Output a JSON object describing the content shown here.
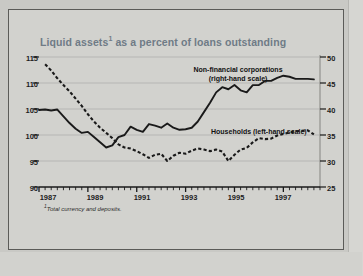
{
  "figure": {
    "background_color": "#d2d2ce",
    "frame_color": "#5b5b58",
    "title_color": "#6f7b86",
    "ink_color": "#1a1a1a"
  },
  "chart_data": {
    "type": "line",
    "title_text_main": "Liquid assets",
    "title_footnote_marker": "1",
    "title_text_rest": " as a percent of loans outstanding",
    "xlabel": "",
    "ylabel": "",
    "grid": true,
    "legend_position": "inline-annotations",
    "footnote": "Total currency and deposits.",
    "footnote_marker": "1",
    "x_axis": {
      "tick_labels": [
        "1987",
        "1989",
        "1991",
        "1993",
        "1995",
        "1997"
      ],
      "tick_values": [
        1987,
        1989,
        1991,
        1993,
        1995,
        1997
      ],
      "minor_tick_interval_years": 0.25,
      "range": [
        1987.0,
        1998.5
      ]
    },
    "y_axis_left": {
      "name": "left-hand scale",
      "tick_labels": [
        "115",
        "110",
        "105",
        "100",
        "95",
        "90"
      ],
      "tick_values": [
        115,
        110,
        105,
        100,
        95,
        90
      ],
      "ylim": [
        90,
        115
      ]
    },
    "y_axis_right": {
      "name": "right-hand scale",
      "tick_labels": [
        "50",
        "45",
        "40",
        "35",
        "30",
        "25"
      ],
      "tick_values": [
        50,
        45,
        40,
        35,
        30,
        25
      ],
      "ylim": [
        25,
        50
      ]
    },
    "series": [
      {
        "name": "Households (left-hand scale)",
        "label_text": "Households (left-hand scale)",
        "axis": "left",
        "style": "dashed",
        "color": "#1a1a1a",
        "x": [
          1987.25,
          1987.5,
          1987.75,
          1988.0,
          1988.25,
          1988.5,
          1988.75,
          1989.0,
          1989.25,
          1989.5,
          1989.75,
          1990.0,
          1990.25,
          1990.5,
          1990.75,
          1991.0,
          1991.25,
          1991.5,
          1991.75,
          1992.0,
          1992.25,
          1992.5,
          1992.75,
          1993.0,
          1993.25,
          1993.5,
          1993.75,
          1994.0,
          1994.25,
          1994.5,
          1994.75,
          1995.0,
          1995.25,
          1995.5,
          1995.75,
          1996.0,
          1996.25,
          1996.5,
          1996.75,
          1997.0,
          1997.25,
          1997.5,
          1997.75,
          1998.0,
          1998.25
        ],
        "values": [
          113.6,
          112.4,
          110.9,
          109.6,
          108.4,
          107.0,
          105.6,
          104.0,
          102.6,
          101.4,
          100.4,
          99.4,
          98.2,
          97.6,
          97.4,
          96.9,
          96.3,
          95.6,
          96.2,
          96.4,
          95.0,
          96.0,
          96.6,
          96.4,
          97.0,
          97.4,
          97.2,
          96.9,
          97.2,
          96.8,
          95.0,
          96.2,
          97.2,
          97.5,
          98.6,
          99.4,
          99.2,
          99.3,
          99.9,
          100.2,
          100.5,
          100.7,
          100.8,
          100.9,
          100.1
        ]
      },
      {
        "name": "Non-financial corporations (right-hand scale)",
        "label_line1": "Non-financial corporations",
        "label_line2": "(right-hand scale)",
        "axis": "right",
        "style": "solid",
        "color": "#1a1a1a",
        "x": [
          1987.0,
          1987.25,
          1987.5,
          1987.75,
          1988.0,
          1988.25,
          1988.5,
          1988.75,
          1989.0,
          1989.25,
          1989.5,
          1989.75,
          1990.0,
          1990.25,
          1990.5,
          1990.75,
          1991.0,
          1991.25,
          1991.5,
          1991.75,
          1992.0,
          1992.25,
          1992.5,
          1992.75,
          1993.0,
          1993.25,
          1993.5,
          1993.75,
          1994.0,
          1994.25,
          1994.5,
          1994.75,
          1995.0,
          1995.25,
          1995.5,
          1995.75,
          1996.0,
          1996.25,
          1996.5,
          1996.75,
          1997.0,
          1997.25,
          1997.5,
          1997.75,
          1998.0,
          1998.25
        ],
        "values": [
          39.8,
          39.9,
          39.7,
          39.9,
          38.6,
          37.3,
          36.2,
          35.4,
          35.6,
          34.6,
          33.6,
          32.6,
          33.0,
          34.6,
          35.0,
          36.6,
          36.0,
          35.6,
          37.1,
          36.8,
          36.4,
          37.2,
          36.4,
          36.0,
          36.1,
          36.4,
          37.6,
          39.4,
          41.2,
          43.2,
          44.2,
          43.8,
          44.6,
          43.6,
          43.2,
          44.6,
          44.6,
          45.4,
          45.4,
          46.0,
          46.4,
          46.2,
          45.8,
          45.8,
          45.8,
          45.7
        ]
      }
    ]
  }
}
